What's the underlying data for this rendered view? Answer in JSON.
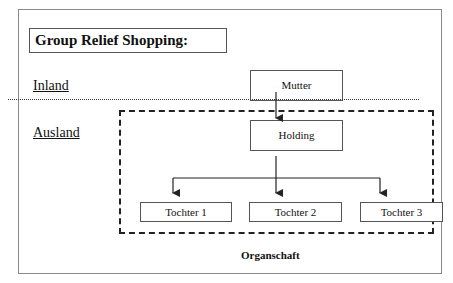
{
  "title": "Group Relief Shopping:",
  "regions": {
    "inland": "Inland",
    "ausland": "Ausland"
  },
  "nodes": {
    "mutter": "Mutter",
    "holding": "Holding",
    "tochter": [
      "Tochter 1",
      "Tochter 2",
      "Tochter 3"
    ]
  },
  "group_label": "Organschaft"
}
